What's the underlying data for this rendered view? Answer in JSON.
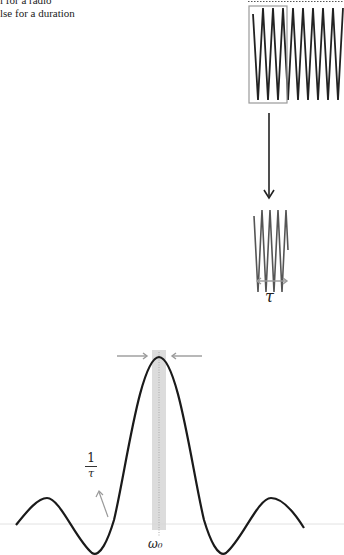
{
  "caption": {
    "line1": "l for a radio",
    "line2": "lse for a duration"
  },
  "figure": {
    "pulse_top_label": "",
    "pulse_duration_label": "τ",
    "spectrum_width_label_num": "1",
    "spectrum_width_label_den": "τ",
    "center_frequency_label": "ω₀"
  },
  "colors": {
    "curve": "#1a1a1a",
    "annotation_gray": "#9a9a9a",
    "highlight_band": "#d6d6d6",
    "baseline": "#e2e2e2"
  }
}
